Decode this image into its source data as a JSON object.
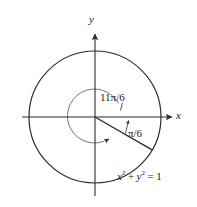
{
  "figure": {
    "type": "unit-circle-angle-diagram",
    "axes": {
      "x_label": "x",
      "y_label": "y",
      "x_axis_y": 117,
      "y_axis_x": 95,
      "x_min": 22,
      "x_max": 174,
      "y_min": 32,
      "y_max": 197
    },
    "circles": [
      {
        "name": "unit-circle",
        "cx": 95,
        "cy": 117,
        "r": 66,
        "stroke": "#2b2b2b",
        "stroke_width": 1.2
      },
      {
        "name": "angle-arc-circle",
        "cx": 95,
        "cy": 117,
        "r": 27,
        "stroke": "#6b6b6b",
        "stroke_width": 0.9
      }
    ],
    "terminal_ray": {
      "name": "terminal-side",
      "angle_deg": -30,
      "from": {
        "x": 95,
        "y": 117
      },
      "to": {
        "x": 152,
        "y": 150
      },
      "stroke": "#2b2b2b",
      "stroke_width": 1.3
    },
    "labels": {
      "angle_large": "11π/6",
      "angle_small": "π/6",
      "equation_lhs_x": "x",
      "equation_lhs_y": "y",
      "equation_exp": "2",
      "equation_plus": "+",
      "equation_eq": "=",
      "equation_rhs": "1"
    },
    "colors": {
      "background": "#ffffff",
      "ink": "#2b2b2b",
      "light_ink": "#6b6b6b",
      "axis": "#3a3a3a"
    }
  }
}
